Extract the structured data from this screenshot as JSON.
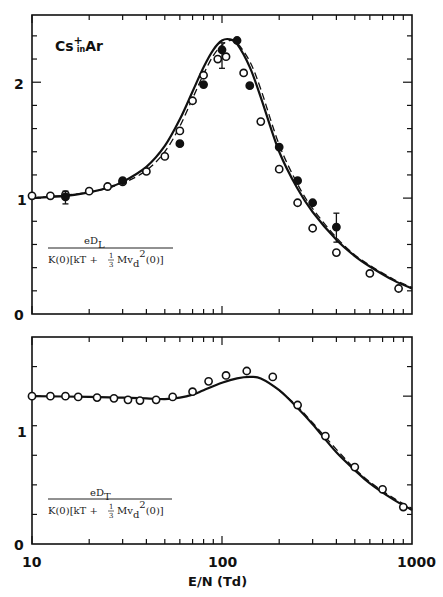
{
  "chart_data": [
    {
      "type": "line",
      "panel": "top",
      "title": "Cs+ in Ar",
      "annotation": {
        "species": "Cs",
        "charge": "+",
        "in": "in",
        "gas": "Ar"
      },
      "ylabel": {
        "numerator": "eD",
        "numerator_sub": "L",
        "denominator": "K(0)[kT + 1/3 Mv_d^2(0)]"
      },
      "xlabel": "E/N (Td)",
      "xscale": "log",
      "xlim": [
        10,
        1000
      ],
      "ylim": [
        0,
        2.58
      ],
      "yticks": [
        "0",
        "1",
        "2"
      ],
      "grid": false,
      "series": [
        {
          "name": "theory_solid",
          "style": "solid",
          "x": [
            10,
            15,
            20,
            25,
            30,
            40,
            50,
            60,
            70,
            80,
            90,
            100,
            110,
            120,
            140,
            160,
            200,
            250,
            300,
            400,
            500,
            600,
            800,
            1000
          ],
          "y": [
            1.0,
            1.02,
            1.05,
            1.09,
            1.14,
            1.27,
            1.45,
            1.68,
            1.92,
            2.13,
            2.28,
            2.36,
            2.37,
            2.33,
            2.13,
            1.87,
            1.4,
            1.08,
            0.88,
            0.64,
            0.5,
            0.41,
            0.29,
            0.22
          ]
        },
        {
          "name": "theory_dashed",
          "style": "dashed",
          "x": [
            10,
            20,
            30,
            40,
            50,
            60,
            70,
            80,
            90,
            100,
            110,
            120,
            140,
            160,
            200,
            250,
            300,
            400,
            500,
            600,
            800,
            1000
          ],
          "y": [
            1.0,
            1.05,
            1.13,
            1.24,
            1.4,
            1.62,
            1.86,
            2.07,
            2.23,
            2.32,
            2.36,
            2.34,
            2.18,
            1.94,
            1.46,
            1.12,
            0.91,
            0.66,
            0.51,
            0.42,
            0.3,
            0.23
          ]
        },
        {
          "name": "experiment_open",
          "marker": "open-circle",
          "x": [
            10,
            12.5,
            15,
            20,
            25,
            30,
            40,
            50,
            60,
            70,
            80,
            95,
            105,
            130,
            160,
            200,
            250,
            300,
            400,
            600,
            850
          ],
          "y": [
            1.02,
            1.02,
            1.03,
            1.06,
            1.1,
            1.14,
            1.23,
            1.36,
            1.58,
            1.84,
            2.06,
            2.2,
            2.22,
            2.08,
            1.66,
            1.25,
            0.96,
            0.74,
            0.53,
            0.35,
            0.22
          ]
        },
        {
          "name": "experiment_filled",
          "marker": "filled-circle",
          "x": [
            15,
            30,
            60,
            80,
            100,
            120,
            140,
            200,
            250,
            300,
            400
          ],
          "y": [
            1.01,
            1.15,
            1.47,
            1.98,
            2.28,
            2.36,
            1.97,
            1.44,
            1.15,
            0.96,
            0.75
          ],
          "error_bars": [
            {
              "x": 15,
              "low": 0.95,
              "high": 1.06
            },
            {
              "x": 100,
              "low": 2.12,
              "high": 2.34
            },
            {
              "x": 400,
              "low": 0.62,
              "high": 0.87
            }
          ]
        }
      ]
    },
    {
      "type": "line",
      "panel": "bottom",
      "ylabel": {
        "numerator": "eD",
        "numerator_sub": "T",
        "denominator": "K(0)[kT + 1/3 Mv_d^2(0)]"
      },
      "xlabel": "E/N (Td)",
      "xscale": "log",
      "xlim": [
        10,
        1000
      ],
      "ylim": [
        0,
        1.4
      ],
      "yticks": [
        "0",
        "1"
      ],
      "xticks": [
        "10",
        "100",
        "1000"
      ],
      "grid": false,
      "series": [
        {
          "name": "theory_solid",
          "style": "solid",
          "x": [
            10,
            20,
            30,
            40,
            50,
            60,
            70,
            80,
            100,
            120,
            140,
            160,
            200,
            250,
            300,
            400,
            500,
            600,
            800,
            1000
          ],
          "y": [
            1.0,
            0.995,
            0.99,
            0.985,
            0.98,
            0.99,
            1.01,
            1.04,
            1.09,
            1.12,
            1.13,
            1.12,
            1.04,
            0.92,
            0.81,
            0.62,
            0.5,
            0.41,
            0.3,
            0.23
          ]
        },
        {
          "name": "theory_dashed",
          "style": "dashed",
          "x": [
            200,
            250,
            300,
            400,
            500,
            600,
            800,
            1000
          ],
          "y": [
            1.04,
            0.93,
            0.82,
            0.64,
            0.51,
            0.42,
            0.31,
            0.24
          ]
        },
        {
          "name": "experiment_open",
          "marker": "open-circle",
          "x": [
            10,
            12.5,
            15,
            17.5,
            22,
            27,
            32,
            37,
            45,
            55,
            70,
            85,
            105,
            135,
            185,
            250,
            350,
            500,
            700,
            900
          ],
          "y": [
            1.0,
            1.0,
            1.0,
            0.995,
            0.99,
            0.985,
            0.975,
            0.97,
            0.975,
            0.995,
            1.03,
            1.1,
            1.14,
            1.17,
            1.13,
            0.94,
            0.73,
            0.52,
            0.37,
            0.25
          ]
        }
      ]
    }
  ],
  "axis": {
    "xtick_labels": [
      "10",
      "100",
      "1000"
    ],
    "xlabel": "E/N (Td)",
    "top_ytick_labels": [
      "0",
      "1",
      "2"
    ],
    "bottom_ytick_labels": [
      "0",
      "1"
    ]
  },
  "labels": {
    "title_species": "Cs",
    "title_charge": "+",
    "title_in": "in",
    "title_gas": "Ar",
    "top_num": "eD",
    "top_num_sub": "L",
    "bottom_num": "eD",
    "bottom_num_sub": "T",
    "den_left": "K(0)[kT + ",
    "den_frac_num": "1",
    "den_frac_den": "3",
    "den_mid": " Mv",
    "den_sub": "d",
    "den_sup": "2",
    "den_right": "(0)]"
  }
}
